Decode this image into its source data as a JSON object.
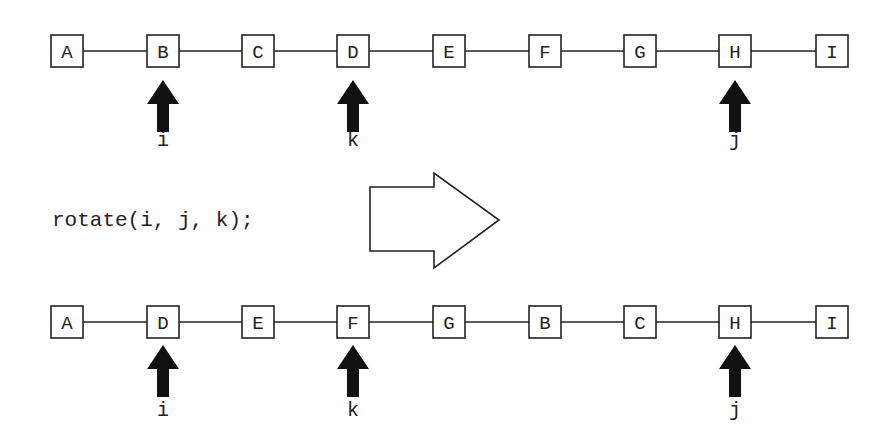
{
  "code": {
    "text": "rotate(i, j, k);"
  },
  "before": {
    "nodes": [
      "A",
      "B",
      "C",
      "D",
      "E",
      "F",
      "G",
      "H",
      "I"
    ],
    "pointers": [
      {
        "label": "i",
        "index": 1
      },
      {
        "label": "k",
        "index": 3
      },
      {
        "label": "j",
        "index": 7
      }
    ]
  },
  "after": {
    "nodes": [
      "A",
      "D",
      "E",
      "F",
      "G",
      "B",
      "C",
      "H",
      "I"
    ],
    "pointers": [
      {
        "label": "i",
        "index": 1
      },
      {
        "label": "k",
        "index": 3
      },
      {
        "label": "j",
        "index": 7
      }
    ]
  },
  "transition_arrow": {
    "icon": "right-arrow-outline-icon"
  },
  "colors": {
    "stroke": "#222222",
    "pointer_fill": "#111111",
    "background": "#ffffff"
  }
}
